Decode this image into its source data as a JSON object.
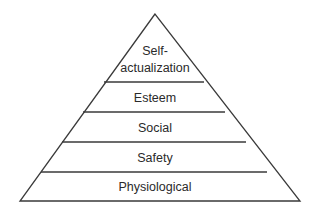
{
  "diagram": {
    "type": "pyramid",
    "colors": {
      "line": "#3a3a3a",
      "text": "#2a2a2a",
      "background": "#ffffff"
    },
    "levels": [
      {
        "label_line1": "Self-",
        "label_line2": "actualization"
      },
      {
        "label": "Esteem"
      },
      {
        "label": "Social"
      },
      {
        "label": "Safety"
      },
      {
        "label": "Physiological"
      }
    ]
  }
}
